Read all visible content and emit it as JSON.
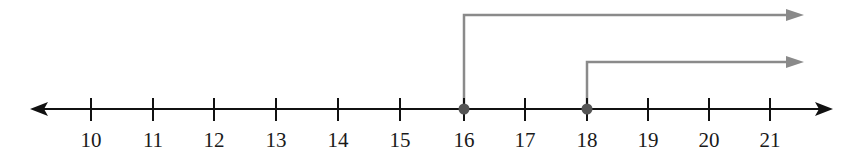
{
  "number_line": {
    "min_label": 10,
    "max_label": 21,
    "ticks": [
      {
        "value": "10",
        "x": 91
      },
      {
        "value": "11",
        "x": 153
      },
      {
        "value": "12",
        "x": 214
      },
      {
        "value": "13",
        "x": 276
      },
      {
        "value": "14",
        "x": 338
      },
      {
        "value": "15",
        "x": 400
      },
      {
        "value": "16",
        "x": 464
      },
      {
        "value": "17",
        "x": 525
      },
      {
        "value": "18",
        "x": 587
      },
      {
        "value": "19",
        "x": 648
      },
      {
        "value": "20",
        "x": 709
      },
      {
        "value": "21",
        "x": 770
      }
    ],
    "axis_color": "#111111",
    "bidirectional": true
  },
  "rays": [
    {
      "start_value": "16",
      "direction": "right",
      "closed_point": true,
      "level": "upper",
      "color": "#8a8a8a"
    },
    {
      "start_value": "18",
      "direction": "right",
      "closed_point": true,
      "level": "lower",
      "color": "#8a8a8a"
    }
  ],
  "points": [
    {
      "value": "16",
      "filled": true,
      "color": "#555555"
    },
    {
      "value": "18",
      "filled": true,
      "color": "#555555"
    }
  ]
}
